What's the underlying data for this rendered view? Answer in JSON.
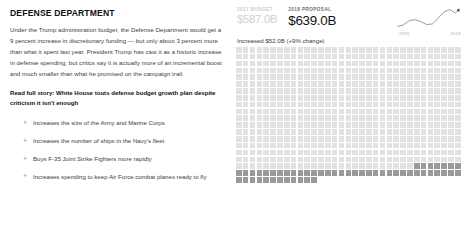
{
  "article": {
    "department_title": "DEFENSE DEPARTMENT",
    "body": "Under the Trump administration budget, the Defense Department would get a 9 percent increase in discretionary funding — but only about 3 percent more than what it spent last year. President Trump has cast it as a historic increase in defense spending, but critics say it is actually more of an incremental boost and much smaller than what he promised on the campaign trail.",
    "read_full_story": "Read full story: White House touts defense budget growth plan despite criticism it isn't enough",
    "bullet_marker": "+",
    "bullets": [
      "Increases the size of the Army and Marine Corps",
      "Increases the number of ships in the Navy's fleet",
      "Buys F-35 Joint Strike Fighters more rapidly",
      "Increases spending to keep Air Force combat planes ready to fly"
    ]
  },
  "figure": {
    "previous": {
      "caption": "2017 BUDGET",
      "value": "$587.0B"
    },
    "current": {
      "caption": "2018 PROPOSAL",
      "value": "$639.0B"
    },
    "delta_text": "Increased $52.0B (+9% change)",
    "colors": {
      "base_cell": "#e2e2e2",
      "increase_cell": "#9a9a9a",
      "muted_text": "#cfcfcf",
      "primary_text": "#111111"
    }
  },
  "chart_data": [
    {
      "type": "line",
      "name": "defense-budget-sparkline",
      "title": "",
      "xlabel": "",
      "ylabel": "",
      "x_tick_labels": [
        "1976",
        "2018"
      ],
      "x": [
        1976,
        1980,
        1984,
        1988,
        1992,
        1996,
        2000,
        2004,
        2008,
        2012,
        2016,
        2018
      ],
      "y": [
        300,
        330,
        420,
        440,
        400,
        340,
        350,
        470,
        600,
        650,
        580,
        639
      ],
      "endpoint_marker": true,
      "grid": false,
      "legend": "none"
    },
    {
      "type": "waffle",
      "name": "budget-waffle",
      "title": "",
      "unit_value_b": 1,
      "columns": 33,
      "rows": 21,
      "total_cells": 639,
      "categories": [
        "2017 base budget",
        "2018 increase"
      ],
      "values": [
        587,
        52
      ],
      "colors": [
        "#e2e2e2",
        "#9a9a9a"
      ],
      "note": "Each cell = $1B of the 2018 proposal; darker cells are the $52.0B increase"
    }
  ]
}
